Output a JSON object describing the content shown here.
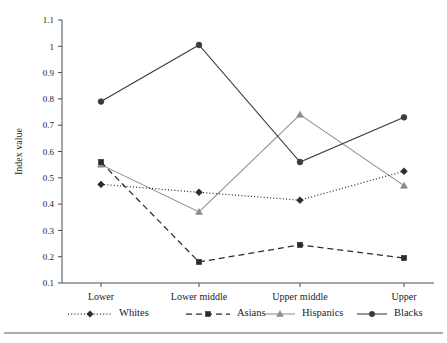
{
  "chart_data": {
    "type": "line",
    "title": "",
    "xlabel": "",
    "ylabel": "Index value",
    "categories": [
      "Lower",
      "Lower middle",
      "Upper middle",
      "Upper"
    ],
    "ylim": [
      0.1,
      1.1
    ],
    "ytick_labels": [
      "0.1",
      "0.2",
      "0.3",
      "0.4",
      "0.5",
      "0.6",
      "0.7",
      "0.8",
      "0.9",
      "1",
      "1.1"
    ],
    "ytick_values": [
      0.1,
      0.2,
      0.3,
      0.4,
      0.5,
      0.6,
      0.7,
      0.8,
      0.9,
      1.0,
      1.1
    ],
    "grid": false,
    "legend_position": "bottom",
    "series": [
      {
        "name": "Whites",
        "values": [
          0.475,
          0.445,
          0.415,
          0.525
        ],
        "marker": "diamond",
        "line_style": "dotted",
        "color": "#2b2b2b"
      },
      {
        "name": "Asians",
        "values": [
          0.56,
          0.18,
          0.245,
          0.195
        ],
        "marker": "square",
        "line_style": "dashed",
        "color": "#2b2b2b"
      },
      {
        "name": "Hispanics",
        "values": [
          0.55,
          0.37,
          0.74,
          0.47
        ],
        "marker": "triangle",
        "line_style": "solid",
        "color": "#8c8c8c"
      },
      {
        "name": "Blacks",
        "values": [
          0.79,
          1.005,
          0.56,
          0.73
        ],
        "marker": "circle",
        "line_style": "solid",
        "color": "#3a3a3a"
      }
    ]
  },
  "axis": {
    "y_title": "Index value"
  },
  "legend": {
    "entries": [
      {
        "label": "Whites"
      },
      {
        "label": "Asians"
      },
      {
        "label": "Hispanics"
      },
      {
        "label": "Blacks"
      }
    ]
  },
  "colors": {
    "axis": "#4a4a4a",
    "dark_series": "#2b2b2b",
    "gray_series": "#8c8c8c",
    "black_series": "#3a3a3a",
    "rule": "#5a5a5a"
  }
}
